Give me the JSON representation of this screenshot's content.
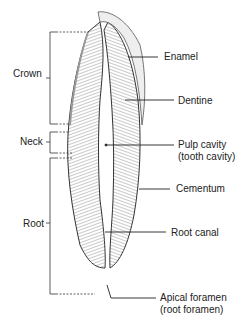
{
  "diagram": {
    "left_labels": {
      "crown": "Crown",
      "neck": "Neck",
      "root": "Root"
    },
    "right_labels": {
      "enamel": "Enamel",
      "dentine": "Dentine",
      "pulp_line1": "Pulp cavity",
      "pulp_line2": "(tooth cavity)",
      "cementum": "Cementum",
      "root_canal": "Root canal",
      "apical_line1": "Apical foramen",
      "apical_line2": "(root foramen)"
    }
  }
}
